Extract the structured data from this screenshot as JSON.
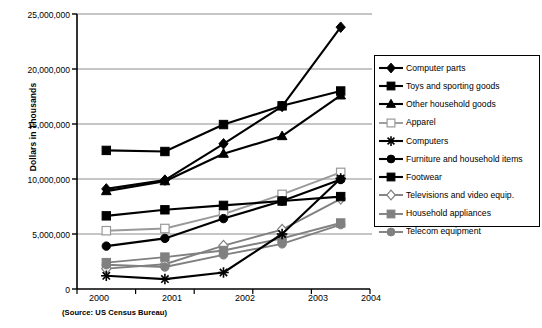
{
  "chart_data": {
    "type": "line",
    "title": "",
    "xlabel": "",
    "ylabel": "Dollars in Thousands",
    "source_note": "(Source: US Census Bureau)",
    "categories": [
      "2000",
      "2001",
      "2002",
      "2003",
      "2004"
    ],
    "ylim": [
      0,
      25000000
    ],
    "yticks": [
      0,
      5000000,
      10000000,
      15000000,
      20000000,
      25000000
    ],
    "ytick_labels": [
      "0",
      "5,000,000",
      "10,000,000",
      "15,000,000",
      "20,000,000",
      "25,000,000"
    ],
    "grid": true,
    "legend_position": "right",
    "series": [
      {
        "name": "Computer parts",
        "marker": "diamond",
        "color": "#000000",
        "filled": true,
        "values": [
          9100000,
          9900000,
          13200000,
          16600000,
          23800000
        ]
      },
      {
        "name": "Toys and sporting goods",
        "marker": "square",
        "color": "#000000",
        "filled": true,
        "values": [
          12600000,
          12500000,
          14950000,
          16650000,
          18000000
        ]
      },
      {
        "name": "Other household goods",
        "marker": "triangle",
        "color": "#000000",
        "filled": true,
        "values": [
          8900000,
          9800000,
          12300000,
          13900000,
          17600000
        ]
      },
      {
        "name": "Apparel",
        "marker": "square",
        "color": "#999999",
        "filled": false,
        "values": [
          5300000,
          5500000,
          6800000,
          8600000,
          10600000
        ]
      },
      {
        "name": "Computers",
        "marker": "star",
        "color": "#000000",
        "filled": true,
        "values": [
          1200000,
          900000,
          1500000,
          5000000,
          10050000
        ]
      },
      {
        "name": "Furniture and household items",
        "marker": "circle",
        "color": "#000000",
        "filled": true,
        "values": [
          3900000,
          4600000,
          6400000,
          8000000,
          9950000
        ]
      },
      {
        "name": "Footwear",
        "marker": "square",
        "color": "#000000",
        "filled": true,
        "values": [
          6650000,
          7200000,
          7600000,
          8000000,
          8400000
        ]
      },
      {
        "name": "Televisions and video equip.",
        "marker": "diamond",
        "color": "#808080",
        "filled": false,
        "values": [
          1850000,
          2250000,
          3950000,
          5400000,
          8200000
        ]
      },
      {
        "name": "Household appliances",
        "marker": "square",
        "color": "#808080",
        "filled": true,
        "values": [
          2400000,
          2900000,
          3500000,
          4600000,
          6000000
        ]
      },
      {
        "name": "Telecom equipment",
        "marker": "circle",
        "color": "#808080",
        "filled": true,
        "values": [
          2200000,
          2000000,
          3100000,
          4100000,
          5850000
        ]
      }
    ]
  },
  "axis": {
    "y_title": "Dollars in Thousands",
    "y_tick_labels": [
      "25,000,000",
      "20,000,000",
      "15,000,000",
      "10,000,000",
      "5,000,000",
      "0"
    ],
    "x_tick_labels": [
      "2000",
      "2001",
      "2002",
      "2003",
      "2004"
    ]
  },
  "legend": {
    "items": [
      {
        "label": "Computer parts"
      },
      {
        "label": "Toys and sporting goods"
      },
      {
        "label": "Other household goods"
      },
      {
        "label": "Apparel"
      },
      {
        "label": "Computers"
      },
      {
        "label": "Furniture and household items"
      },
      {
        "label": "Footwear"
      },
      {
        "label": "Televisions and video equip."
      },
      {
        "label": "Household appliances"
      },
      {
        "label": "Telecom equipment"
      }
    ]
  },
  "footer": {
    "source": "(Source: US Census Bureau)"
  },
  "colors": {
    "axis": "#000000",
    "grid": "#8c8c8c",
    "dark_series": "#000000",
    "gray_series": "#808080",
    "light_gray_series": "#999999",
    "background": "#ffffff"
  }
}
